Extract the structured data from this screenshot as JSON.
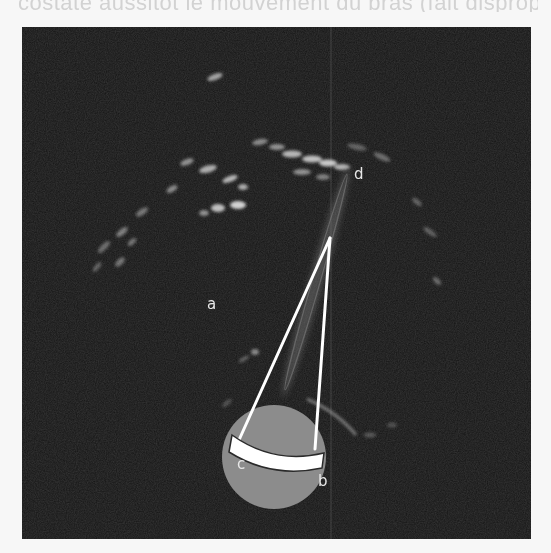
{
  "header": {
    "cut_off_text": "costate aussitôt le mouvement du bras (fait disproportion)"
  },
  "figure": {
    "type": "ultrasound-diagram",
    "background_color": "#141414",
    "probe_circle_color": "#8c8c8c",
    "beam_color": "#ffffff",
    "labels": {
      "a": "a",
      "b": "b",
      "c": "c",
      "d": "d"
    }
  }
}
